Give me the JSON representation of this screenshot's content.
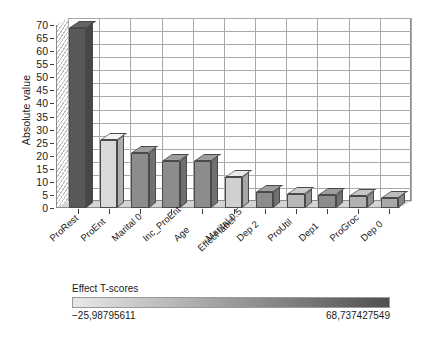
{
  "chart_data": {
    "type": "bar",
    "title": "",
    "xlabel": "Effect label",
    "ylabel": "Absolute value",
    "categories": [
      "ProRest",
      "ProEnt",
      "Marital 0",
      "Inc_ProEnt",
      "Age",
      "Marital 0.5",
      "Dep 2",
      "ProUtil",
      "Dep1",
      "ProGroc",
      "Dep 0"
    ],
    "values": [
      69,
      26,
      21,
      18,
      18,
      12,
      6,
      5.5,
      5,
      4.5,
      4
    ],
    "bar_colors": [
      "#595959",
      "#d9d9d9",
      "#8c8c8c",
      "#8c8c8c",
      "#8c8c8c",
      "#d0d0d0",
      "#8c8c8c",
      "#b8b8b8",
      "#8c8c8c",
      "#b0b0b0",
      "#a8a8a8"
    ],
    "ylim": [
      0,
      70
    ],
    "ytick_step": 5,
    "yticks": [
      "0",
      "5",
      "10",
      "15",
      "20",
      "25",
      "30",
      "35",
      "40",
      "45",
      "50",
      "55",
      "60",
      "65",
      "70"
    ],
    "grid": true,
    "legend_position": "bottom"
  },
  "legend": {
    "title": "Effect T-scores",
    "min_label": "−25,98795611",
    "max_label": "68,737427549",
    "gradient_start": "#e8e8e8",
    "gradient_end": "#4f4f4f"
  }
}
